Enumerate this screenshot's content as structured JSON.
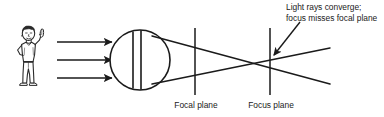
{
  "figure": {
    "background_color": "#ffffff",
    "line_color": "#1a1a1a",
    "annotation": {
      "line1": "Light rays converge;",
      "line2": "focus misses focal plane"
    },
    "labels": {
      "focal_plane": "Focal plane",
      "focus_plane": "Focus plane"
    },
    "elements": {
      "observer": "cartoon-person-pointing",
      "eye": "eyeball-circle-with-lens",
      "incoming_rays": 3,
      "ray_direction": "left-to-right",
      "pointer": "annotation-arrow"
    }
  }
}
